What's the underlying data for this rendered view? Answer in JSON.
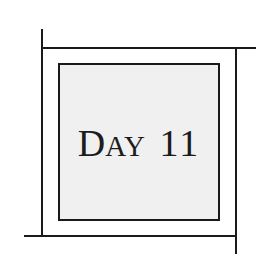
{
  "title": {
    "full_text": "DAY 11",
    "word_cap": "D",
    "word_rest": "AY",
    "number": "11"
  },
  "colors": {
    "line": "#1a1a1a",
    "inner_fill": "#f0f0f0",
    "background": "#ffffff",
    "text": "#1c1c1c"
  }
}
